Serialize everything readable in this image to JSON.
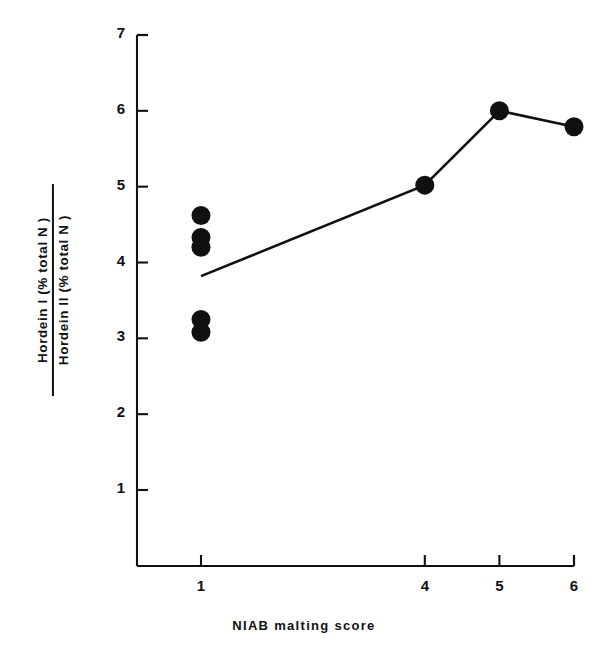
{
  "chart_data": {
    "type": "scatter",
    "title": "",
    "xlabel": "NIAB malting score",
    "ylabel": "Hordein I (% total N) / Hordein II (% total N)",
    "ylabel_numerator": "Hordein I (% total N )",
    "ylabel_denominator": "Hordein II (% total N )",
    "xlim": [
      0.4,
      6.45
    ],
    "ylim": [
      0.3,
      7.25
    ],
    "xticks": [
      "1",
      "4",
      "5",
      "6"
    ],
    "xtick_values": [
      1,
      4,
      5,
      6
    ],
    "yticks": [
      "1",
      "2",
      "3",
      "4",
      "5",
      "6",
      "7"
    ],
    "ytick_values": [
      1,
      2,
      3,
      4,
      5,
      6,
      7
    ],
    "grid": false,
    "legend": false,
    "marker": "filled-circle",
    "marker_color": "#101010",
    "line_color": "#101010",
    "series": [
      {
        "name": "Scatter points at malting score 1",
        "type": "scatter",
        "points": [
          {
            "x": 1,
            "y": 4.62
          },
          {
            "x": 1,
            "y": 4.33
          },
          {
            "x": 1,
            "y": 4.2
          },
          {
            "x": 1,
            "y": 3.25
          },
          {
            "x": 1,
            "y": 3.08
          }
        ]
      },
      {
        "name": "Mean trend line",
        "type": "line",
        "points": [
          {
            "x": 1,
            "y": 3.82
          },
          {
            "x": 4,
            "y": 5.02
          },
          {
            "x": 5,
            "y": 6.0
          },
          {
            "x": 6,
            "y": 5.79
          }
        ],
        "markers_at": [
          {
            "x": 4,
            "y": 5.02
          },
          {
            "x": 5,
            "y": 6.0
          },
          {
            "x": 6,
            "y": 5.79
          }
        ]
      }
    ]
  },
  "axes": {
    "y_axis_name": "y-axis",
    "x_axis_name": "x-axis"
  }
}
